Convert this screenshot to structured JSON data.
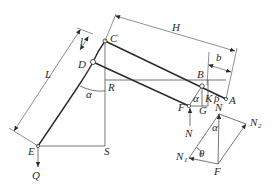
{
  "diagram": {
    "title": "",
    "main_figure": {
      "points": {
        "A": "A",
        "B": "B",
        "C": "C",
        "D": "D",
        "E": "E",
        "F": "F",
        "G": "G",
        "K": "K",
        "R": "R",
        "S": "S"
      },
      "dimensions": {
        "H": "H",
        "b": "b",
        "L": "L",
        "l": "l"
      },
      "angles": {
        "alpha_main": "α",
        "alpha_small": "α",
        "beta": "β"
      },
      "forces": {
        "N": "N",
        "Q": "Q"
      }
    },
    "force_diagram": {
      "labels": {
        "N": "N",
        "N1": "N",
        "N1_sub": "1",
        "N2": "N",
        "N2_sub": "2",
        "F": "F",
        "alpha": "α",
        "theta": "θ"
      }
    },
    "colors": {
      "line": "#2a2a2a",
      "background": "#ffffff"
    }
  }
}
